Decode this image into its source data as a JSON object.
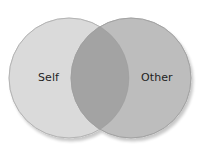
{
  "diagram": {
    "type": "venn",
    "sets": [
      {
        "id": "self",
        "label": "Self",
        "fill": "#dadada",
        "stroke": "#c4c4c4"
      },
      {
        "id": "other",
        "label": "Other",
        "fill": "#bdbdbd",
        "stroke": "#a9a9a9"
      }
    ],
    "overlap": {
      "fill": "#a3a3a3"
    },
    "background": "#ffffff"
  }
}
